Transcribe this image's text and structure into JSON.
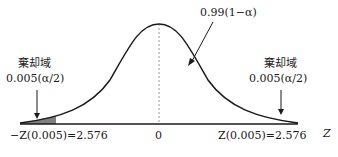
{
  "diagram": {
    "title": "",
    "center_label": "0.99(1−α)",
    "left_region": {
      "label": "棄却域",
      "value": "0.005(α/2)"
    },
    "right_region": {
      "label": "棄却域",
      "value": "0.005(α/2)"
    },
    "axis": {
      "left_tick": "−Z(0.005)=2.576",
      "center_tick": "0",
      "right_tick": "Z(0.005)=2.576",
      "axis_label": "Z"
    },
    "colors": {
      "curve": "#1a1a1a",
      "shade": "#808080",
      "dashed": "#999999"
    }
  }
}
